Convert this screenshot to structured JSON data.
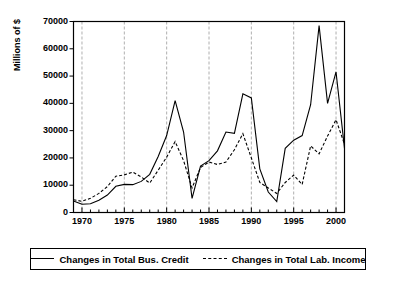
{
  "chart_data": {
    "type": "line",
    "title": "",
    "xlabel": "",
    "ylabel": "Millions of $",
    "xlim": [
      1969,
      2001
    ],
    "ylim": [
      0,
      70000
    ],
    "grid": true,
    "grid_axis": "x",
    "legend_position": "below",
    "y_ticks": [
      0,
      10000,
      20000,
      30000,
      40000,
      50000,
      60000,
      70000
    ],
    "y_tick_labels": [
      "0",
      "10000",
      "20000",
      "30000",
      "40000",
      "50000",
      "60000",
      "70000"
    ],
    "x_ticks_major": [
      1970,
      1975,
      1980,
      1985,
      1990,
      1995,
      2000
    ],
    "x_tick_labels": [
      "1970",
      "1975",
      "1980",
      "1985",
      "1990",
      "1995",
      "2000"
    ],
    "x_minor_tick_step": 1,
    "x": [
      1969,
      1970,
      1971,
      1972,
      1973,
      1974,
      1975,
      1976,
      1977,
      1978,
      1979,
      1980,
      1981,
      1982,
      1983,
      1984,
      1985,
      1986,
      1987,
      1988,
      1989,
      1990,
      1991,
      1992,
      1993,
      1994,
      1995,
      1996,
      1997,
      1998,
      1999,
      2000,
      2001
    ],
    "series": [
      {
        "name": "Changes in Total Bus. Credit",
        "style": "solid",
        "color": "#000000",
        "values": [
          4200,
          3000,
          3200,
          4500,
          6400,
          9600,
          10300,
          10200,
          11400,
          14000,
          20500,
          28200,
          41000,
          29500,
          5200,
          17000,
          19000,
          22600,
          29500,
          29000,
          43500,
          42000,
          16000,
          7500,
          4000,
          23500,
          26500,
          28200,
          39500,
          68500,
          40000,
          51500,
          23500
        ]
      },
      {
        "name": "Changes in Total Lab. Income",
        "style": "dashed",
        "color": "#000000",
        "values": [
          4700,
          4100,
          5200,
          7000,
          9500,
          13300,
          13800,
          14800,
          13000,
          10800,
          15500,
          20300,
          26000,
          19000,
          9000,
          16500,
          18500,
          17600,
          18500,
          23000,
          28900,
          20000,
          11000,
          9000,
          7000,
          11000,
          13700,
          10300,
          24400,
          21500,
          28000,
          34000,
          25000
        ]
      }
    ]
  },
  "axis": {
    "y_title": "Millions of $"
  },
  "legend": {
    "entries": [
      {
        "label": "Changes in Total Bus. Credit",
        "style": "solid"
      },
      {
        "label": "Changes in Total Lab. Income",
        "style": "dashed"
      }
    ]
  }
}
